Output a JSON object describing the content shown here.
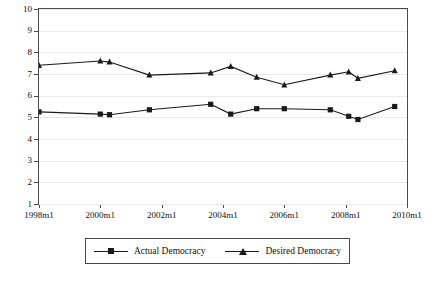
{
  "chart_data": {
    "type": "line",
    "title": "",
    "xlabel": "",
    "ylabel": "",
    "ylim": [
      1,
      10
    ],
    "yticks": [
      1,
      2,
      3,
      4,
      5,
      6,
      7,
      8,
      9,
      10
    ],
    "xlim": [
      1998,
      2010
    ],
    "xticks": [
      "1998m1",
      "2000m1",
      "2002m1",
      "2004m1",
      "2006m1",
      "2008m1",
      "2010m1"
    ],
    "grid": true,
    "legend_position": "bottom",
    "x": [
      1998.0,
      2000.0,
      2000.3,
      2001.6,
      2003.6,
      2004.25,
      2005.1,
      2006.0,
      2007.5,
      2008.1,
      2008.4,
      2009.6
    ],
    "series": [
      {
        "name": "Actual Democracy",
        "marker": "square",
        "values": [
          5.25,
          5.15,
          5.12,
          5.35,
          5.6,
          5.15,
          5.4,
          5.4,
          5.35,
          5.05,
          4.9,
          5.5
        ]
      },
      {
        "name": "Desired Democracy",
        "marker": "triangle",
        "values": [
          7.4,
          7.6,
          7.55,
          6.95,
          7.05,
          7.35,
          6.85,
          6.5,
          6.95,
          7.1,
          6.8,
          7.15
        ]
      }
    ]
  },
  "legend": {
    "entries": [
      {
        "label": "Actual Democracy",
        "marker": "square-marker"
      },
      {
        "label": "Desired Democracy",
        "marker": "triangle-marker"
      }
    ]
  },
  "axes": {
    "y_labels": [
      "10",
      "9",
      "8",
      "7",
      "6",
      "5",
      "4",
      "3",
      "2",
      "1"
    ],
    "x_labels": [
      "1998m1",
      "2000m1",
      "2002m1",
      "2004m1",
      "2006m1",
      "2008m1",
      "2010m1"
    ]
  }
}
